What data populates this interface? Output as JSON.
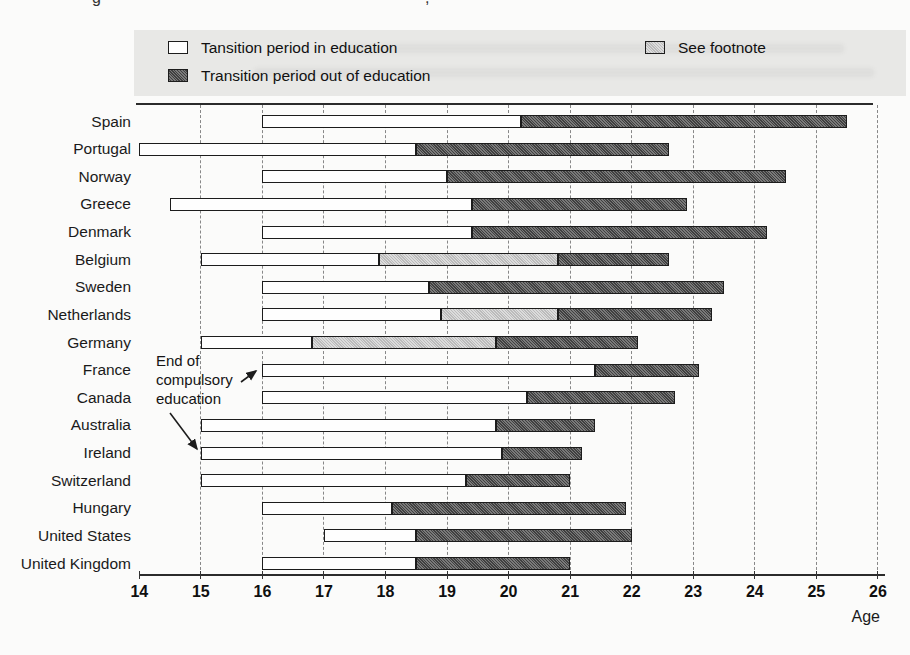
{
  "remnants": [
    "g",
    ","
  ],
  "colors": {
    "in_education": "#fefefe",
    "out_of_education": "#555555",
    "footnote": "#c9c9c9",
    "legend_band": "#e8e8e6",
    "bar_border": "#1c1c1c"
  },
  "legend": {
    "items": [
      {
        "key": "in",
        "label": "Tansition period in education"
      },
      {
        "key": "out",
        "label": "Transition period out of education"
      },
      {
        "key": "footnote",
        "label": "See footnote"
      }
    ]
  },
  "annotation": {
    "lines": [
      "End of",
      "compulsory",
      "education"
    ]
  },
  "axis": {
    "label": "Age"
  },
  "chart_data": {
    "type": "bar",
    "orientation": "horizontal-stacked-range",
    "title": "",
    "xlabel": "Age",
    "ylabel": "",
    "x_axis": {
      "min": 14,
      "max": 26,
      "ticks": [
        14,
        15,
        16,
        17,
        18,
        19,
        20,
        21,
        22,
        23,
        24,
        25,
        26
      ]
    },
    "grid": "vertical-dashed",
    "legend_entries": [
      "Tansition period in education",
      "Transition period out of education",
      "See footnote"
    ],
    "countries": [
      {
        "name": "Spain",
        "segments": [
          {
            "type": "in",
            "start": 16.0,
            "end": 20.2
          },
          {
            "type": "out",
            "start": 20.2,
            "end": 25.5
          }
        ]
      },
      {
        "name": "Portugal",
        "segments": [
          {
            "type": "in",
            "start": 14.0,
            "end": 18.5
          },
          {
            "type": "out",
            "start": 18.5,
            "end": 22.6
          }
        ]
      },
      {
        "name": "Norway",
        "segments": [
          {
            "type": "in",
            "start": 16.0,
            "end": 19.0
          },
          {
            "type": "out",
            "start": 19.0,
            "end": 24.5
          }
        ]
      },
      {
        "name": "Greece",
        "segments": [
          {
            "type": "in",
            "start": 14.5,
            "end": 19.4
          },
          {
            "type": "out",
            "start": 19.4,
            "end": 22.9
          }
        ]
      },
      {
        "name": "Denmark",
        "segments": [
          {
            "type": "in",
            "start": 16.0,
            "end": 19.4
          },
          {
            "type": "out",
            "start": 19.4,
            "end": 24.2
          }
        ]
      },
      {
        "name": "Belgium",
        "segments": [
          {
            "type": "in",
            "start": 15.0,
            "end": 17.9
          },
          {
            "type": "footnote",
            "start": 17.9,
            "end": 20.8
          },
          {
            "type": "out",
            "start": 20.8,
            "end": 22.6
          }
        ]
      },
      {
        "name": "Sweden",
        "segments": [
          {
            "type": "in",
            "start": 16.0,
            "end": 18.7
          },
          {
            "type": "out",
            "start": 18.7,
            "end": 23.5
          }
        ]
      },
      {
        "name": "Netherlands",
        "segments": [
          {
            "type": "in",
            "start": 16.0,
            "end": 18.9
          },
          {
            "type": "footnote",
            "start": 18.9,
            "end": 20.8
          },
          {
            "type": "out",
            "start": 20.8,
            "end": 23.3
          }
        ]
      },
      {
        "name": "Germany",
        "segments": [
          {
            "type": "in",
            "start": 15.0,
            "end": 16.8
          },
          {
            "type": "footnote",
            "start": 16.8,
            "end": 19.8
          },
          {
            "type": "out",
            "start": 19.8,
            "end": 22.1
          }
        ]
      },
      {
        "name": "France",
        "segments": [
          {
            "type": "in",
            "start": 16.0,
            "end": 21.4
          },
          {
            "type": "out",
            "start": 21.4,
            "end": 23.1
          }
        ]
      },
      {
        "name": "Canada",
        "segments": [
          {
            "type": "in",
            "start": 16.0,
            "end": 20.3
          },
          {
            "type": "out",
            "start": 20.3,
            "end": 22.7
          }
        ]
      },
      {
        "name": "Australia",
        "segments": [
          {
            "type": "in",
            "start": 15.0,
            "end": 19.8
          },
          {
            "type": "out",
            "start": 19.8,
            "end": 21.4
          }
        ]
      },
      {
        "name": "Ireland",
        "segments": [
          {
            "type": "in",
            "start": 15.0,
            "end": 19.9
          },
          {
            "type": "out",
            "start": 19.9,
            "end": 21.2
          }
        ]
      },
      {
        "name": "Switzerland",
        "segments": [
          {
            "type": "in",
            "start": 15.0,
            "end": 19.3
          },
          {
            "type": "out",
            "start": 19.3,
            "end": 21.0
          }
        ]
      },
      {
        "name": "Hungary",
        "segments": [
          {
            "type": "in",
            "start": 16.0,
            "end": 18.1
          },
          {
            "type": "out",
            "start": 18.1,
            "end": 21.9
          }
        ]
      },
      {
        "name": "United States",
        "segments": [
          {
            "type": "in",
            "start": 17.0,
            "end": 18.5
          },
          {
            "type": "out",
            "start": 18.5,
            "end": 22.0
          }
        ]
      },
      {
        "name": "United Kingdom",
        "segments": [
          {
            "type": "in",
            "start": 16.0,
            "end": 18.5
          },
          {
            "type": "out",
            "start": 18.5,
            "end": 21.0
          }
        ]
      }
    ]
  }
}
